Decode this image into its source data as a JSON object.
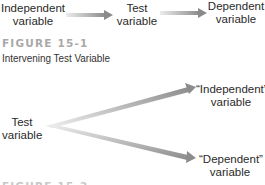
{
  "figure1": {
    "nodes": {
      "independent": {
        "line1": "Independent",
        "line2": "variable"
      },
      "test": {
        "line1": "Test",
        "line2": "variable"
      },
      "dependent": {
        "line1": "Dependent",
        "line2": "variable"
      }
    },
    "label": "FIGURE 15-1",
    "caption": "Intervening Test Variable"
  },
  "figure2": {
    "nodes": {
      "test": {
        "line1": "Test",
        "line2": "variable"
      },
      "independent": {
        "line1": "“Independent”",
        "line2": "variable"
      },
      "dependent": {
        "line1": "“Dependent”",
        "line2": "variable"
      }
    },
    "label": "FIGURE 15-2"
  },
  "colors": {
    "arrow_light": "#e6e6e6",
    "arrow_dark": "#8c8c8c",
    "figure_label": "#a9a9a9",
    "text": "#2a2a2a"
  }
}
